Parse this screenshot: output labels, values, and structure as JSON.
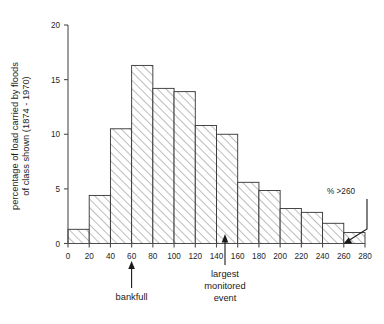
{
  "chart_data": {
    "type": "bar",
    "title": "",
    "subtitle": "",
    "xlabel": "",
    "ylabel": "percentage of load carried by floods of class shown (1874 - 1970)",
    "ylabel_line1": "percentage of load carried by floods",
    "ylabel_line2": "of class shown (1874 - 1970)",
    "xlim": [
      0,
      280
    ],
    "ylim": [
      0,
      20
    ],
    "grid": false,
    "legend": null,
    "bin_width": 20,
    "bin_edges": [
      0,
      20,
      40,
      60,
      80,
      100,
      120,
      140,
      160,
      180,
      200,
      220,
      240,
      260,
      280
    ],
    "categories": [
      "0-20",
      "20-40",
      "40-60",
      "60-80",
      "80-100",
      "100-120",
      "120-140",
      "140-160",
      "160-180",
      "180-200",
      "200-220",
      "220-240",
      "240-260",
      "260-280"
    ],
    "values": [
      1.3,
      4.4,
      10.5,
      16.3,
      14.2,
      13.9,
      10.8,
      10.0,
      5.6,
      4.85,
      3.2,
      2.85,
      1.85,
      1.0
    ],
    "xticks": [
      0,
      20,
      40,
      60,
      80,
      100,
      120,
      140,
      160,
      180,
      200,
      220,
      240,
      260,
      280
    ],
    "xticklabels": [
      "0",
      "20",
      "40",
      "60",
      "80",
      "100",
      "120",
      "140",
      "160",
      "180",
      "200",
      "220",
      "240",
      "260",
      "280"
    ],
    "yticks": [
      0,
      5,
      10,
      15,
      20
    ],
    "yticklabels": [
      "0",
      "5",
      "10",
      "15",
      "20"
    ],
    "annotations": [
      {
        "id": "bankfull",
        "label": "bankfull",
        "label_lines": [
          "bankfull"
        ],
        "x_value": 60,
        "style": "arrow-up-below-axis"
      },
      {
        "id": "largest-monitored-event",
        "label": "largest monitored event",
        "label_lines": [
          "largest",
          "monitored",
          "event"
        ],
        "x_value": 148,
        "style": "arrow-up-below-axis"
      },
      {
        "id": "percent-over-260",
        "label": "% >260",
        "label_lines": [
          "% >260"
        ],
        "x_value": 270,
        "style": "leader-line-arrow-into-bar"
      }
    ]
  },
  "colors": {
    "background": "#ffffff",
    "axis": "#4d4d4d",
    "bar_edge": "#333333",
    "hatch": "#8c8c8c",
    "text": "#1a1a1a"
  }
}
